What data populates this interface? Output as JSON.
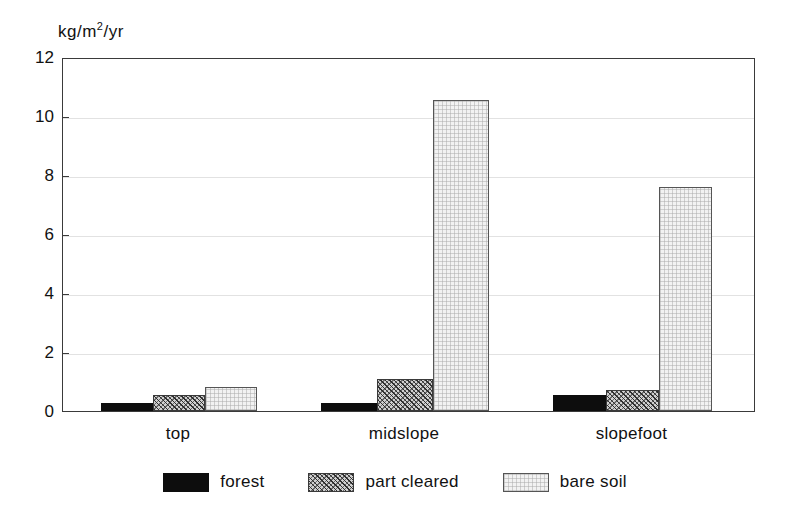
{
  "chart_data": {
    "type": "bar",
    "title": "",
    "subtitle": "",
    "xlabel": "",
    "ylabel": "kg/m2/yr",
    "ylabel_parts": {
      "pre": "kg/m",
      "sup": "2",
      "post": "/yr"
    },
    "categories": [
      "top",
      "midslope",
      "slopefoot"
    ],
    "series": [
      {
        "name": "forest",
        "values": [
          0.27,
          0.27,
          0.55
        ],
        "fill": "solid-black",
        "color": "#0d0d0d"
      },
      {
        "name": "part cleared",
        "values": [
          0.55,
          1.08,
          0.7
        ],
        "fill": "diagonal-hatch",
        "color": "#cfcfcf"
      },
      {
        "name": "bare soil",
        "values": [
          0.8,
          10.55,
          7.6
        ],
        "fill": "light-stipple",
        "color": "#f2f2f2"
      }
    ],
    "ylim": [
      0,
      12
    ],
    "yticks": [
      0,
      2,
      4,
      6,
      8,
      10,
      12
    ],
    "ytick_labels": [
      "0",
      "2",
      "4",
      "6",
      "8",
      "10",
      "12"
    ],
    "grid": "horizontal",
    "legend_position": "bottom-center",
    "frame": "box"
  },
  "legend": {
    "items": [
      {
        "label": "forest"
      },
      {
        "label": "part cleared"
      },
      {
        "label": "bare soil"
      }
    ]
  },
  "axis": {
    "unit_label": "kg/m2/yr"
  }
}
